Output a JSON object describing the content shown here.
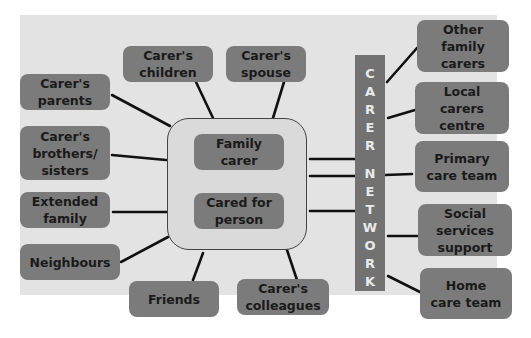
{
  "diagram": {
    "center": {
      "top": "Family\ncarer",
      "bottom": "Cared for\nperson"
    },
    "left_nodes": [
      "Carer's\nchildren",
      "Carer's\nspouse",
      "Carer's\nparents",
      "Carer's\nbrothers/\nsisters",
      "Extended\nfamily",
      "Neighbours",
      "Friends",
      "Carer's\ncolleagues"
    ],
    "network_label": [
      "C",
      "A",
      "R",
      "E",
      "R",
      " ",
      "N",
      "E",
      "T",
      "W",
      "O",
      "R",
      "K"
    ],
    "right_nodes": [
      "Other\nfamily\ncarers",
      "Local\ncarers\ncentre",
      "Primary\ncare team",
      "Social\nservices\nsupport",
      "Home\ncare team"
    ],
    "colors": {
      "background": "#e3e3e3",
      "node": "#7b7b7b",
      "network_bar": "#727272",
      "connector": "#111111"
    }
  }
}
